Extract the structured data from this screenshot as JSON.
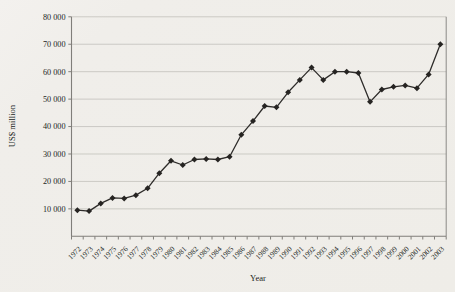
{
  "page": {
    "background": "#f0eeea"
  },
  "chart": {
    "y_axis_title": "US$ million",
    "x_axis_title": "Year",
    "y_tick_labels": [
      "10 000",
      "20 000",
      "30 000",
      "40 000",
      "50 000",
      "60 000",
      "70 000",
      "80 000"
    ]
  },
  "chart_data": {
    "type": "line",
    "title": "",
    "xlabel": "Year",
    "ylabel": "US$ million",
    "x": [
      1972,
      1973,
      1974,
      1975,
      1976,
      1977,
      1978,
      1979,
      1980,
      1981,
      1982,
      1983,
      1984,
      1985,
      1986,
      1987,
      1988,
      1989,
      1990,
      1991,
      1992,
      1993,
      1994,
      1995,
      1996,
      1997,
      1998,
      1999,
      2000,
      2001,
      2002,
      2003
    ],
    "values": [
      9500,
      9200,
      12000,
      14000,
      13800,
      15000,
      17500,
      23000,
      27500,
      26000,
      28000,
      28200,
      28000,
      29000,
      37000,
      42000,
      47500,
      47000,
      52500,
      57000,
      61500,
      57000,
      60000,
      60000,
      59500,
      49000,
      53500,
      54500,
      55000,
      54000,
      59000,
      70000
    ],
    "ylim": [
      0,
      80000
    ],
    "y_tick_step": 10000,
    "grid": true,
    "legend_position": "none",
    "marker": "diamond",
    "line_color": "#2e2c2a",
    "marker_color": "#262422",
    "grid_color": "#bcbab5",
    "axis_color": "#807e7a",
    "text_color": "#211f1d"
  }
}
